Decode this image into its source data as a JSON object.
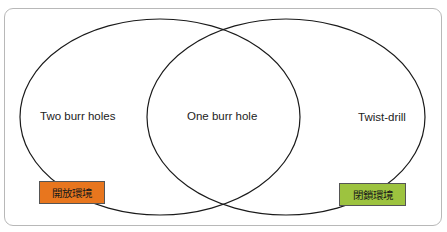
{
  "diagram": {
    "type": "venn",
    "sets": [
      {
        "id": "left",
        "label": "Two burr holes"
      },
      {
        "id": "right",
        "label": "Twist-drill"
      }
    ],
    "intersection": {
      "label": "One burr hole"
    },
    "tags": [
      {
        "label": "開放環境",
        "color": "#e8761e"
      },
      {
        "label": "閉鎖環境",
        "color": "#9dc33f"
      }
    ],
    "colors": {
      "stroke": "#1a1a1a",
      "frame": "#b8b8b8"
    }
  }
}
